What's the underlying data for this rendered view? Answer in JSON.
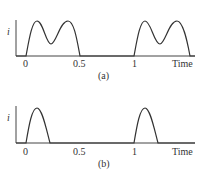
{
  "panels": [
    {
      "id": "a",
      "caption": "(a)",
      "ylabel": "i",
      "xlabel": "Time",
      "ticks": [
        "0",
        "0.5",
        "1"
      ],
      "description": "Full-wave pulses: two humps per interval, repeating every period of 1"
    },
    {
      "id": "b",
      "caption": "(b)",
      "ylabel": "i",
      "xlabel": "Time",
      "ticks": [
        "0",
        "0.5",
        "1"
      ],
      "description": "Half-wave pulses: single hump per period of 1"
    }
  ],
  "colors": {
    "line": "#333333",
    "background": "#ffffff"
  }
}
